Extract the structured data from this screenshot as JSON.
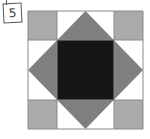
{
  "figure": {
    "label": "5",
    "colors": {
      "corner": "#aaaaaa",
      "diamond": "#7f7f7f",
      "center": "#161616",
      "background": "#ffffff",
      "grid_line": "#8a8a8a"
    },
    "grid": {
      "rows": 4,
      "cols": 4
    }
  }
}
